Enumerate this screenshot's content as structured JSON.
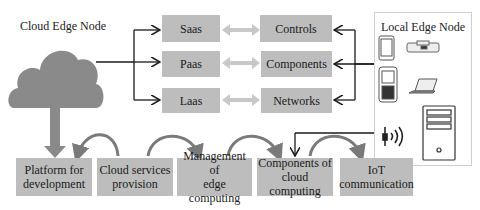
{
  "cloud_node": {
    "title": "Cloud Edge Node"
  },
  "service_models": [
    {
      "label": "Saas"
    },
    {
      "label": "Paas"
    },
    {
      "label": "Laas"
    }
  ],
  "resources": [
    {
      "label": "Controls"
    },
    {
      "label": "Components"
    },
    {
      "label": "Networks"
    }
  ],
  "local_node": {
    "title": "Local Edge Node",
    "devices": [
      "tablet-icon",
      "camera-icon",
      "phone-icon",
      "laptop-icon",
      "wireless-sensor-icon",
      "server-tower-icon"
    ]
  },
  "process_steps": [
    {
      "line1": "Platform for",
      "line2": "development"
    },
    {
      "line1": "Cloud services",
      "line2": "provision"
    },
    {
      "line1": "Management of",
      "line2": "edge computing"
    },
    {
      "line1": "Components of",
      "line2": "cloud computing"
    },
    {
      "line1": "IoT",
      "line2": "communication"
    }
  ],
  "colors": {
    "box_fill": "#bdbdbd",
    "cloud_fill": "#8a8a8a",
    "arrow_fill": "#8a8a8a",
    "double_arrow_fill": "#c8c8c8",
    "line": "#1a1a1a"
  }
}
